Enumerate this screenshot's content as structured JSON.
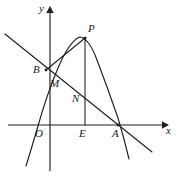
{
  "figure": {
    "type": "geometry-diagram",
    "width": 179,
    "height": 177,
    "background_color": "#ffffff",
    "ink_color": "#1f1f1f"
  },
  "axes": {
    "x_axis": {
      "label": "x",
      "label_pos": {
        "x": 166,
        "y": 126
      },
      "line": {
        "x1": 8,
        "y1": 125,
        "x2": 162,
        "y2": 125
      },
      "arrow_tip": {
        "x": 167,
        "y": 125
      },
      "has_arrow": true
    },
    "y_axis": {
      "label": "y",
      "label_pos": {
        "x": 39,
        "y": 4
      },
      "line": {
        "x1": 50,
        "y1": 12,
        "x2": 50,
        "y2": 170
      },
      "arrow_tip": {
        "x": 50,
        "y": 7
      },
      "has_arrow": true
    },
    "origin": {
      "label": "O",
      "label_pos": {
        "x": 36,
        "y": 128
      },
      "point": {
        "x": 50,
        "y": 125
      }
    }
  },
  "points": [
    {
      "name": "P",
      "label": "P",
      "x": 85,
      "y": 38,
      "label_pos": {
        "x": 88,
        "y": 24
      },
      "marker": true
    },
    {
      "name": "B",
      "label": "B",
      "x": 46,
      "y": 70,
      "label_pos": {
        "x": 33,
        "y": 66
      },
      "marker": true
    },
    {
      "name": "M",
      "label": "M",
      "x": 50,
      "y": 78,
      "label_pos": {
        "x": 50,
        "y": 79
      },
      "marker": false
    },
    {
      "name": "N",
      "label": "N",
      "x": 85,
      "y": 103,
      "label_pos": {
        "x": 72,
        "y": 94
      },
      "marker": false
    },
    {
      "name": "E",
      "label": "E",
      "x": 85,
      "y": 125,
      "label_pos": {
        "x": 80,
        "y": 128
      },
      "marker": false
    },
    {
      "name": "A",
      "label": "A",
      "x": 118,
      "y": 125,
      "label_pos": {
        "x": 113,
        "y": 128
      },
      "marker": true
    }
  ],
  "curves": {
    "parabola": {
      "name": "parabola",
      "path": "M 26 166 Q 32 148 40 124 Q 50 90 62 62 Q 72 40 79 37 Q 87 37 96 58 Q 108 88 118 118 Q 124 138 129 159",
      "vertex_approx": {
        "x": 80,
        "y": 37
      },
      "x_intercepts": [
        {
          "x": 39,
          "y": 125
        },
        {
          "x": 118,
          "y": 125
        }
      ]
    },
    "line_BA": {
      "name": "line-through-B-and-A",
      "path": "M 5 34 L 152 152",
      "passes_through": [
        "B",
        "M",
        "N",
        "A"
      ]
    }
  },
  "segments": [
    {
      "name": "segment-BP",
      "from": "B",
      "to": "P",
      "path": "M 46 70 L 85 38"
    },
    {
      "name": "segment-PE",
      "from": "P",
      "to": "E",
      "path": "M 85 38 L 85 125"
    }
  ],
  "colors": {
    "ink": "#1f1f1f",
    "label": "#1a1a1a",
    "background": "#ffffff"
  }
}
